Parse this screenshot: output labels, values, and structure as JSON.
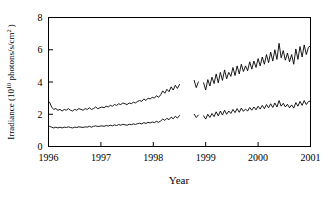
{
  "chart_data": {
    "type": "line",
    "title": "",
    "xlabel": "Year",
    "ylabel": "Irradiance (10¹⁰ photons/s/cm² )",
    "ylabel_parts": {
      "main": "Irradiance (10",
      "sup1": "10",
      "mid": " photons/s/cm",
      "sup2": "2",
      "tail": " )"
    },
    "xlim": [
      1996,
      2001
    ],
    "ylim": [
      0,
      8
    ],
    "xticks": [
      1996,
      1997,
      1998,
      1999,
      2000,
      2001
    ],
    "xticklabels": [
      "1996",
      "1997",
      "1998",
      "1999",
      "2000",
      "2001"
    ],
    "yticks": [
      0,
      2,
      4,
      6,
      8
    ],
    "yticklabels": [
      "0",
      "2",
      "4",
      "6",
      "8"
    ],
    "grid": false,
    "legend": "none",
    "frame": "box",
    "line_color": "#000000",
    "data_gaps": [
      [
        1998.52,
        1998.76
      ],
      [
        1998.86,
        1998.94
      ]
    ],
    "series": [
      {
        "name": "upper-irradiance-series",
        "color": "#000000",
        "x": [
          1996.02,
          1996.06,
          1996.1,
          1996.14,
          1996.18,
          1996.22,
          1996.26,
          1996.3,
          1996.34,
          1996.38,
          1996.42,
          1996.46,
          1996.5,
          1996.54,
          1996.58,
          1996.62,
          1996.66,
          1996.7,
          1996.74,
          1996.78,
          1996.82,
          1996.86,
          1996.9,
          1996.94,
          1996.98,
          1997.02,
          1997.06,
          1997.1,
          1997.14,
          1997.18,
          1997.22,
          1997.26,
          1997.3,
          1997.34,
          1997.38,
          1997.42,
          1997.46,
          1997.5,
          1997.54,
          1997.58,
          1997.62,
          1997.66,
          1997.7,
          1997.74,
          1997.78,
          1997.82,
          1997.86,
          1997.9,
          1997.94,
          1997.98,
          1998.02,
          1998.06,
          1998.1,
          1998.14,
          1998.18,
          1998.22,
          1998.26,
          1998.3,
          1998.34,
          1998.38,
          1998.42,
          1998.46,
          1998.5,
          1998.78,
          1998.82,
          1998.86,
          1998.96,
          1999.0,
          1999.04,
          1999.08,
          1999.12,
          1999.16,
          1999.2,
          1999.24,
          1999.28,
          1999.32,
          1999.36,
          1999.4,
          1999.44,
          1999.48,
          1999.52,
          1999.56,
          1999.6,
          1999.64,
          1999.68,
          1999.72,
          1999.76,
          1999.8,
          1999.84,
          1999.88,
          1999.92,
          1999.96,
          2000.0,
          2000.04,
          2000.08,
          2000.12,
          2000.16,
          2000.2,
          2000.24,
          2000.28,
          2000.32,
          2000.36,
          2000.4,
          2000.44,
          2000.48,
          2000.52,
          2000.56,
          2000.6,
          2000.64,
          2000.68,
          2000.72,
          2000.76,
          2000.8,
          2000.84,
          2000.88,
          2000.92,
          2000.96,
          2001.0
        ],
        "y": [
          2.75,
          2.45,
          2.3,
          2.35,
          2.25,
          2.3,
          2.2,
          2.3,
          2.25,
          2.35,
          2.25,
          2.2,
          2.3,
          2.25,
          2.35,
          2.3,
          2.25,
          2.35,
          2.3,
          2.4,
          2.3,
          2.35,
          2.45,
          2.35,
          2.4,
          2.45,
          2.4,
          2.5,
          2.45,
          2.55,
          2.5,
          2.6,
          2.55,
          2.65,
          2.6,
          2.7,
          2.65,
          2.6,
          2.7,
          2.65,
          2.75,
          2.7,
          2.8,
          2.85,
          2.8,
          2.95,
          2.85,
          3.0,
          2.95,
          3.05,
          3.0,
          3.15,
          3.05,
          3.2,
          3.45,
          3.3,
          3.55,
          3.4,
          3.7,
          3.5,
          3.8,
          3.6,
          3.85,
          4.1,
          3.65,
          4.0,
          3.95,
          3.5,
          4.15,
          3.75,
          4.3,
          3.9,
          4.5,
          3.95,
          4.6,
          4.1,
          4.75,
          4.2,
          4.6,
          4.35,
          4.9,
          4.4,
          5.0,
          4.5,
          5.1,
          4.65,
          5.0,
          4.7,
          5.25,
          4.8,
          5.3,
          4.9,
          5.45,
          5.0,
          5.55,
          5.1,
          5.7,
          5.2,
          5.85,
          5.3,
          6.0,
          5.4,
          6.4,
          5.5,
          5.95,
          5.35,
          5.8,
          5.25,
          5.7,
          5.1,
          6.05,
          5.4,
          6.2,
          5.55,
          6.3,
          5.7,
          6.15,
          6.25
        ]
      },
      {
        "name": "lower-irradiance-series",
        "color": "#000000",
        "x": [
          1996.02,
          1996.06,
          1996.1,
          1996.14,
          1996.18,
          1996.22,
          1996.26,
          1996.3,
          1996.34,
          1996.38,
          1996.42,
          1996.46,
          1996.5,
          1996.54,
          1996.58,
          1996.62,
          1996.66,
          1996.7,
          1996.74,
          1996.78,
          1996.82,
          1996.86,
          1996.9,
          1996.94,
          1996.98,
          1997.02,
          1997.06,
          1997.1,
          1997.14,
          1997.18,
          1997.22,
          1997.26,
          1997.3,
          1997.34,
          1997.38,
          1997.42,
          1997.46,
          1997.5,
          1997.54,
          1997.58,
          1997.62,
          1997.66,
          1997.7,
          1997.74,
          1997.78,
          1997.82,
          1997.86,
          1997.9,
          1997.94,
          1997.98,
          1998.02,
          1998.06,
          1998.1,
          1998.14,
          1998.18,
          1998.22,
          1998.26,
          1998.3,
          1998.34,
          1998.38,
          1998.42,
          1998.46,
          1998.5,
          1998.78,
          1998.82,
          1998.86,
          1998.96,
          1999.0,
          1999.04,
          1999.08,
          1999.12,
          1999.16,
          1999.2,
          1999.24,
          1999.28,
          1999.32,
          1999.36,
          1999.4,
          1999.44,
          1999.48,
          1999.52,
          1999.56,
          1999.6,
          1999.64,
          1999.68,
          1999.72,
          1999.76,
          1999.8,
          1999.84,
          1999.88,
          1999.92,
          1999.96,
          2000.0,
          2000.04,
          2000.08,
          2000.12,
          2000.16,
          2000.2,
          2000.24,
          2000.28,
          2000.32,
          2000.36,
          2000.4,
          2000.44,
          2000.48,
          2000.52,
          2000.56,
          2000.6,
          2000.64,
          2000.68,
          2000.72,
          2000.76,
          2000.8,
          2000.84,
          2000.88,
          2000.92,
          2000.96,
          2001.0
        ],
        "y": [
          1.25,
          1.2,
          1.15,
          1.2,
          1.15,
          1.2,
          1.15,
          1.2,
          1.18,
          1.22,
          1.18,
          1.15,
          1.2,
          1.18,
          1.22,
          1.2,
          1.18,
          1.22,
          1.2,
          1.25,
          1.2,
          1.25,
          1.28,
          1.24,
          1.26,
          1.28,
          1.25,
          1.3,
          1.27,
          1.32,
          1.28,
          1.34,
          1.3,
          1.36,
          1.32,
          1.38,
          1.34,
          1.32,
          1.38,
          1.35,
          1.4,
          1.37,
          1.42,
          1.44,
          1.4,
          1.48,
          1.43,
          1.5,
          1.46,
          1.52,
          1.48,
          1.56,
          1.5,
          1.58,
          1.7,
          1.62,
          1.75,
          1.66,
          1.82,
          1.72,
          1.88,
          1.76,
          1.92,
          2.0,
          1.8,
          1.95,
          1.9,
          1.7,
          2.0,
          1.8,
          2.05,
          1.85,
          2.15,
          1.9,
          2.2,
          1.95,
          2.25,
          2.0,
          2.2,
          2.05,
          2.3,
          2.1,
          2.35,
          2.12,
          2.38,
          2.18,
          2.32,
          2.2,
          2.42,
          2.25,
          2.45,
          2.28,
          2.5,
          2.32,
          2.55,
          2.35,
          2.6,
          2.4,
          2.65,
          2.42,
          2.7,
          2.45,
          2.85,
          2.5,
          2.68,
          2.45,
          2.62,
          2.4,
          2.58,
          2.38,
          2.72,
          2.5,
          2.8,
          2.55,
          2.85,
          2.6,
          2.78,
          2.82
        ]
      }
    ]
  },
  "caption": {
    "faint_line": " "
  }
}
